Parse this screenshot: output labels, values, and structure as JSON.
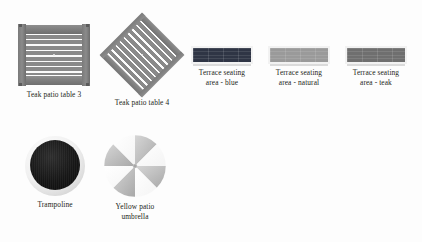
{
  "canvas": {
    "width": 422,
    "height": 242,
    "background": "#fdfdfd"
  },
  "palette": {
    "wood_gray": "#8a8a8a",
    "rail_gray": "#7c7c7c",
    "slat_gap": "#fbfbfb",
    "seat_blue": "#2f3545",
    "seat_natural": "#9a9a9a",
    "seat_teak": "#6f6f6f",
    "seat_frame": "#f2f2f2",
    "trampoline_mat": "#141414",
    "trampoline_ring": "#e8e8e8",
    "umbrella_light": "#ffffff",
    "umbrella_shade": "#bfbfbf",
    "caption_text": "#231f20"
  },
  "items": [
    {
      "id": "teak-patio-table-3",
      "label": "Teak patio table 3",
      "kind": "slat-table",
      "orientation": "axis-aligned",
      "x": 18,
      "y": 24,
      "thumb_width": 72,
      "thumb_height": 62,
      "slat_count": 8
    },
    {
      "id": "teak-patio-table-4",
      "label": "Teak patio table 4",
      "kind": "slat-table",
      "orientation": "rotated-45",
      "x": 103,
      "y": 16,
      "thumb_width": 78,
      "thumb_height": 78,
      "slat_count": 10
    },
    {
      "id": "terrace-seating-area-blue",
      "label": "Terrace seating\narea - blue",
      "kind": "seating-bar",
      "color": "#2f3545",
      "x": 191,
      "y": 46,
      "thumb_width": 62,
      "thumb_height": 18
    },
    {
      "id": "terrace-seating-area-natural",
      "label": "Terrace seating\narea - natural",
      "kind": "seating-bar",
      "color": "#9a9a9a",
      "x": 268,
      "y": 46,
      "thumb_width": 62,
      "thumb_height": 18
    },
    {
      "id": "terrace-seating-area-teak",
      "label": "Terrace seating\narea - teak",
      "kind": "seating-bar",
      "color": "#6f6f6f",
      "x": 345,
      "y": 46,
      "thumb_width": 62,
      "thumb_height": 18
    },
    {
      "id": "trampoline",
      "label": "Trampoline",
      "kind": "trampoline",
      "x": 25,
      "y": 136,
      "thumb_width": 60,
      "thumb_height": 60
    },
    {
      "id": "yellow-patio-umbrella",
      "label": "Yellow patio\numbrella",
      "kind": "umbrella",
      "panels": 8,
      "x": 103,
      "y": 134,
      "thumb_width": 64,
      "thumb_height": 64
    }
  ]
}
